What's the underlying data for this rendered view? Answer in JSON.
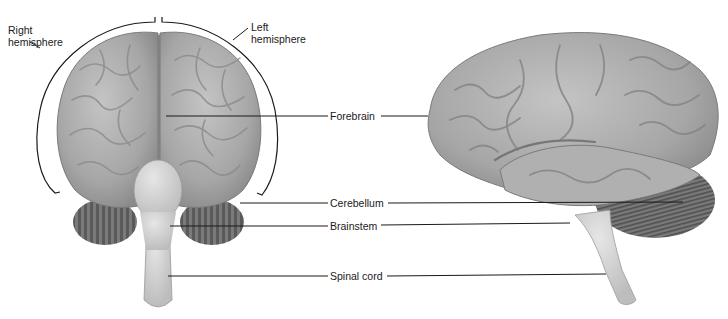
{
  "diagram": {
    "views": [
      {
        "name": "front-view",
        "label": "anterior view"
      },
      {
        "name": "side-view",
        "label": "lateral view"
      }
    ],
    "labels": {
      "right_hemisphere_line1": "Right",
      "right_hemisphere_line2": "hemisphere",
      "left_hemisphere_line1": "Left",
      "left_hemisphere_line2": "hemisphere",
      "forebrain": "Forebrain",
      "cerebellum": "Cerebellum",
      "brainstem": "Brainstem",
      "spinal_cord": "Spinal cord"
    },
    "colors": {
      "cortex": "#a9a9a9",
      "cortex_dark": "#7d7d7d",
      "cerebellum": "#6e6e6e",
      "stem": "#d4d4d4",
      "leader_line": "#1a1a1a"
    }
  }
}
